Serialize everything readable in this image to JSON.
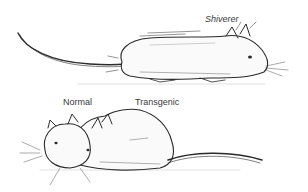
{
  "figure": {
    "labels": {
      "shiverer": "Shiverer",
      "normal": "Normal",
      "transgenic": "Transgenic"
    },
    "colors": {
      "ink": "#2a2a2a",
      "background": "#ffffff"
    }
  }
}
